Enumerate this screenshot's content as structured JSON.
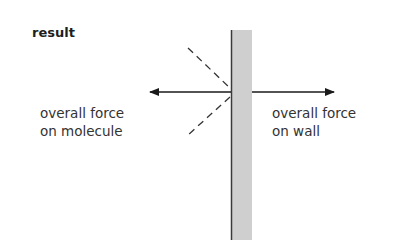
{
  "diagram": {
    "title": "result",
    "labels": {
      "molecule_force_line1": "overall force",
      "molecule_force_line2": "on molecule",
      "wall_force_line1": "overall force",
      "wall_force_line2": "on wall"
    },
    "colors": {
      "wall_fill": "#cfcfcf",
      "wall_edge": "#3a3a3a",
      "arrow": "#1a1a1a",
      "dashed": "#333333"
    }
  }
}
